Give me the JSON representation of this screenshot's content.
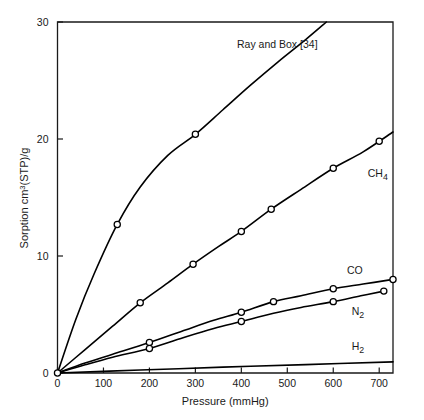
{
  "chart_data": {
    "type": "line",
    "title": "",
    "annotation": "Ray and Box [34]",
    "xlabel": "Pressure (mmHg)",
    "ylabel": "Sorption cm3(STP)/g",
    "ylabel_parts": {
      "pre": "Sorption cm",
      "sup": "3",
      "post": "(STP)/g"
    },
    "xlim": [
      0,
      730
    ],
    "ylim": [
      0,
      30
    ],
    "xticks": [
      0,
      100,
      200,
      300,
      400,
      500,
      600,
      700
    ],
    "yticks": [
      0,
      10,
      20,
      30
    ],
    "grid": false,
    "legend_position": "inline-right-of-curves",
    "marker": "open-circle",
    "line_color": "#000000",
    "series": [
      {
        "name": "",
        "label": "",
        "label_html": "",
        "points": [
          [
            0,
            0
          ],
          [
            130,
            12.7
          ],
          [
            300,
            20.4
          ]
        ],
        "curve": [
          [
            0,
            0
          ],
          [
            40,
            4.6
          ],
          [
            80,
            8.5
          ],
          [
            130,
            12.7
          ],
          [
            180,
            15.9
          ],
          [
            240,
            18.6
          ],
          [
            300,
            20.4
          ],
          [
            360,
            22.5
          ],
          [
            420,
            24.6
          ],
          [
            480,
            26.6
          ],
          [
            540,
            28.5
          ],
          [
            585,
            30.0
          ]
        ],
        "label_x": 0,
        "label_y": 0
      },
      {
        "name": "CH4",
        "label": "CH4",
        "label_html": "CH<sub>4</sub>",
        "points": [
          [
            180,
            6.0
          ],
          [
            295,
            9.3
          ],
          [
            400,
            12.1
          ],
          [
            465,
            14.0
          ],
          [
            600,
            17.5
          ],
          [
            700,
            19.8
          ]
        ],
        "curve": [
          [
            0,
            0
          ],
          [
            60,
            2.0
          ],
          [
            120,
            4.0
          ],
          [
            180,
            6.0
          ],
          [
            240,
            7.7
          ],
          [
            295,
            9.3
          ],
          [
            350,
            10.8
          ],
          [
            400,
            12.1
          ],
          [
            465,
            14.0
          ],
          [
            530,
            15.7
          ],
          [
            600,
            17.5
          ],
          [
            665,
            18.9
          ],
          [
            730,
            20.6
          ]
        ],
        "label_x": 675,
        "label_y": 17.0
      },
      {
        "name": "CO",
        "label": "CO",
        "label_html": "CO",
        "points": [
          [
            200,
            2.6
          ],
          [
            400,
            5.2
          ],
          [
            470,
            6.1
          ],
          [
            600,
            7.2
          ],
          [
            730,
            8.0
          ]
        ],
        "curve": [
          [
            0,
            0
          ],
          [
            60,
            0.85
          ],
          [
            120,
            1.6
          ],
          [
            200,
            2.6
          ],
          [
            280,
            3.7
          ],
          [
            340,
            4.5
          ],
          [
            400,
            5.2
          ],
          [
            470,
            6.1
          ],
          [
            530,
            6.6
          ],
          [
            600,
            7.2
          ],
          [
            665,
            7.6
          ],
          [
            730,
            8.0
          ]
        ],
        "label_x": 630,
        "label_y": 8.7
      },
      {
        "name": "N2",
        "label": "N2",
        "label_html": "N<sub>2</sub>",
        "points": [
          [
            200,
            2.1
          ],
          [
            400,
            4.4
          ],
          [
            600,
            6.1
          ],
          [
            710,
            7.0
          ]
        ],
        "curve": [
          [
            0,
            0
          ],
          [
            60,
            0.7
          ],
          [
            120,
            1.35
          ],
          [
            200,
            2.1
          ],
          [
            280,
            3.1
          ],
          [
            340,
            3.8
          ],
          [
            400,
            4.4
          ],
          [
            470,
            5.1
          ],
          [
            530,
            5.6
          ],
          [
            600,
            6.1
          ],
          [
            660,
            6.6
          ],
          [
            710,
            7.0
          ]
        ],
        "label_x": 640,
        "label_y": 5.2
      },
      {
        "name": "H2",
        "label": "H2",
        "label_html": "H<sub>2</sub>",
        "points": [],
        "curve": [
          [
            0,
            0
          ],
          [
            180,
            0.25
          ],
          [
            360,
            0.5
          ],
          [
            540,
            0.72
          ],
          [
            730,
            0.95
          ]
        ],
        "label_x": 640,
        "label_y": 2.2
      }
    ]
  },
  "axes": {
    "x_tick_labels": [
      "0",
      "100",
      "200",
      "300",
      "400",
      "500",
      "600",
      "700"
    ],
    "y_tick_labels": [
      "0",
      "10",
      "20",
      "30"
    ],
    "x_title": "Pressure (mmHg)",
    "y_title_pre": "Sorption cm",
    "y_title_sup": "3",
    "y_title_post": "(STP)/g"
  },
  "labels": {
    "annotation": "Ray and Box [34]",
    "ch4": "CH",
    "ch4_sub": "4",
    "co": "CO",
    "n2": "N",
    "n2_sub": "2",
    "h2": "H",
    "h2_sub": "2"
  }
}
